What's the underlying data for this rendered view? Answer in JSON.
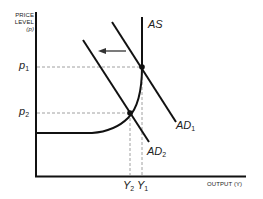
{
  "diagram": {
    "type": "aggregate supply / aggregate demand shift",
    "y_axis": {
      "title_line1": "PRICE",
      "title_line2": "LEVEL",
      "title_line3": "(p)"
    },
    "x_axis": {
      "title": "OUTPUT (Y)"
    },
    "price_ticks": [
      {
        "base": "p",
        "sub": "1"
      },
      {
        "base": "p",
        "sub": "2"
      }
    ],
    "output_ticks": [
      {
        "base": "Y",
        "sub": "2"
      },
      {
        "base": "Y",
        "sub": "1"
      }
    ],
    "curves": {
      "as": {
        "label": "AS"
      },
      "ad1": {
        "base": "AD",
        "sub": "1"
      },
      "ad2": {
        "base": "AD",
        "sub": "2"
      }
    },
    "shift_arrow": "leftward shift of aggregate demand from AD1 to AD2",
    "colors": {
      "line": "#111111",
      "guide": "#888888",
      "background": "#ffffff"
    }
  }
}
